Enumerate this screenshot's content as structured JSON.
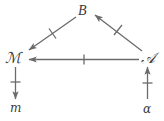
{
  "diagram": {
    "type": "commutative-diagram",
    "background_color": "#ffffff",
    "stroke_color": "#6b6b6b",
    "text_color": "#3a3a3a",
    "nodes": [
      {
        "id": "B",
        "label": "B",
        "style": "italic-capital",
        "x": 85,
        "y": 12
      },
      {
        "id": "M",
        "label": "ℳ",
        "style": "script-capital",
        "x": 14,
        "y": 59
      },
      {
        "id": "A",
        "label": "𝒜",
        "style": "script-capital",
        "x": 148,
        "y": 59
      },
      {
        "id": "m",
        "label": "m",
        "style": "lowercase-italic",
        "x": 16,
        "y": 108
      },
      {
        "id": "alpha",
        "label": "α",
        "style": "greek-lowercase",
        "x": 148,
        "y": 109
      }
    ],
    "edges": [
      {
        "id": "A-to-B",
        "from": "A",
        "to": "B",
        "direction": "up-left",
        "tick_marks": 1
      },
      {
        "id": "B-to-M",
        "from": "B",
        "to": "M",
        "direction": "down-left",
        "tick_marks": 1
      },
      {
        "id": "A-to-M",
        "from": "A",
        "to": "M",
        "direction": "left",
        "tick_marks": 1
      },
      {
        "id": "M-to-m",
        "from": "M",
        "to": "m",
        "direction": "down",
        "tick_marks": 1
      },
      {
        "id": "alpha-to-A",
        "from": "alpha",
        "to": "A",
        "direction": "up",
        "tick_marks": 1
      }
    ]
  }
}
